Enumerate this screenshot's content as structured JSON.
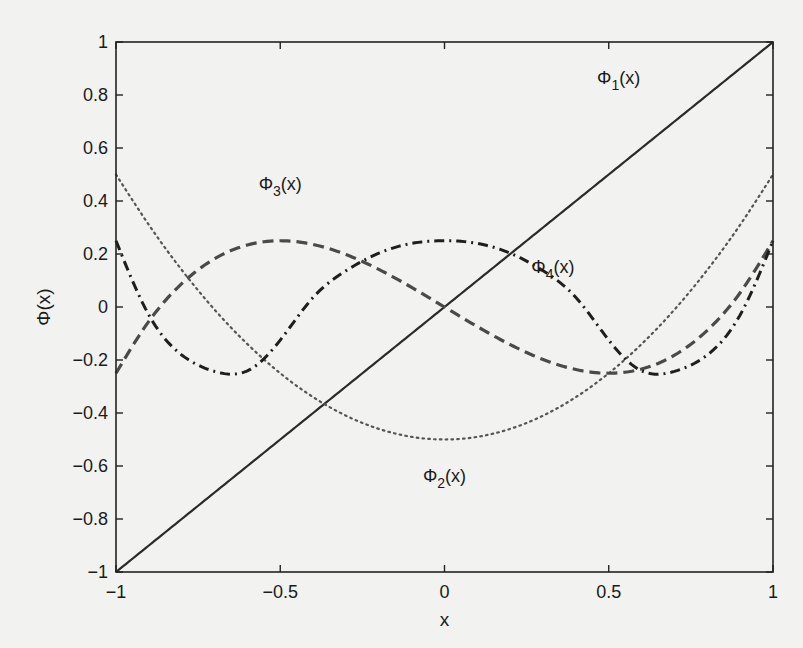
{
  "chart_data": {
    "type": "line",
    "title": "",
    "xlabel": "x",
    "ylabel": "Φ(x)",
    "xlim": [
      -1,
      1
    ],
    "ylim": [
      -1,
      1
    ],
    "grid": false,
    "legend": "inline labels",
    "x_ticks": [
      "-1",
      "-0.5",
      "0",
      "0.5",
      "1"
    ],
    "x_tick_values": [
      -1,
      -0.5,
      0,
      0.5,
      1
    ],
    "y_ticks": [
      "-1",
      "-0.8",
      "-0.6",
      "-0.4",
      "-0.2",
      "0",
      "0.2",
      "0.4",
      "0.6",
      "0.8",
      "1"
    ],
    "y_tick_values": [
      -1,
      -0.8,
      -0.6,
      -0.4,
      -0.2,
      0,
      0.2,
      0.4,
      0.6,
      0.8,
      1
    ],
    "x": [
      -1,
      -0.9,
      -0.8,
      -0.7,
      -0.6,
      -0.5,
      -0.4,
      -0.3,
      -0.2,
      -0.1,
      0,
      0.1,
      0.2,
      0.3,
      0.4,
      0.5,
      0.6,
      0.7,
      0.8,
      0.9,
      1
    ],
    "series": [
      {
        "name": "Φ1(x)",
        "label_main": "Φ",
        "label_sub": "1",
        "label_suffix": "(x)",
        "style": "solid",
        "color": "#2a2a2a",
        "label_pos": [
          0.53,
          0.84
        ],
        "values": [
          -1,
          -0.9,
          -0.8,
          -0.7,
          -0.6,
          -0.5,
          -0.4,
          -0.3,
          -0.2,
          -0.1,
          0,
          0.1,
          0.2,
          0.3,
          0.4,
          0.5,
          0.6,
          0.7,
          0.8,
          0.9,
          1
        ]
      },
      {
        "name": "Φ2(x)",
        "label_main": "Φ",
        "label_sub": "2",
        "label_suffix": "(x)",
        "style": "dotted",
        "color": "#555555",
        "label_pos": [
          0.0,
          -0.66
        ],
        "values": [
          0.5,
          0.31,
          0.14,
          -0.01,
          -0.14,
          -0.25,
          -0.34,
          -0.41,
          -0.46,
          -0.49,
          -0.5,
          -0.49,
          -0.46,
          -0.41,
          -0.34,
          -0.25,
          -0.14,
          -0.01,
          0.14,
          0.31,
          0.5
        ]
      },
      {
        "name": "Φ3(x)",
        "label_main": "Φ",
        "label_sub": "3",
        "label_suffix": "(x)",
        "style": "dashed",
        "color": "#4a4a4a",
        "label_pos": [
          -0.5,
          0.44
        ],
        "values": [
          -0.25,
          -0.054,
          0.088,
          0.182,
          0.234,
          0.25,
          0.236,
          0.198,
          0.142,
          0.074,
          0,
          -0.074,
          -0.142,
          -0.198,
          -0.236,
          -0.25,
          -0.234,
          -0.182,
          -0.088,
          0.054,
          0.25
        ]
      },
      {
        "name": "Φ4(x)",
        "label_main": "Φ",
        "label_sub": "4",
        "label_suffix": "(x)",
        "style": "dashdot",
        "color": "#1e1e1e",
        "label_pos": [
          0.33,
          0.13
        ],
        "values": [
          0.25,
          -0.03,
          -0.181,
          -0.243,
          -0.241,
          -0.125,
          0.036,
          0.137,
          0.203,
          0.24,
          0.25,
          0.24,
          0.203,
          0.137,
          0.036,
          -0.125,
          -0.241,
          -0.243,
          -0.181,
          -0.03,
          0.25
        ]
      }
    ]
  }
}
